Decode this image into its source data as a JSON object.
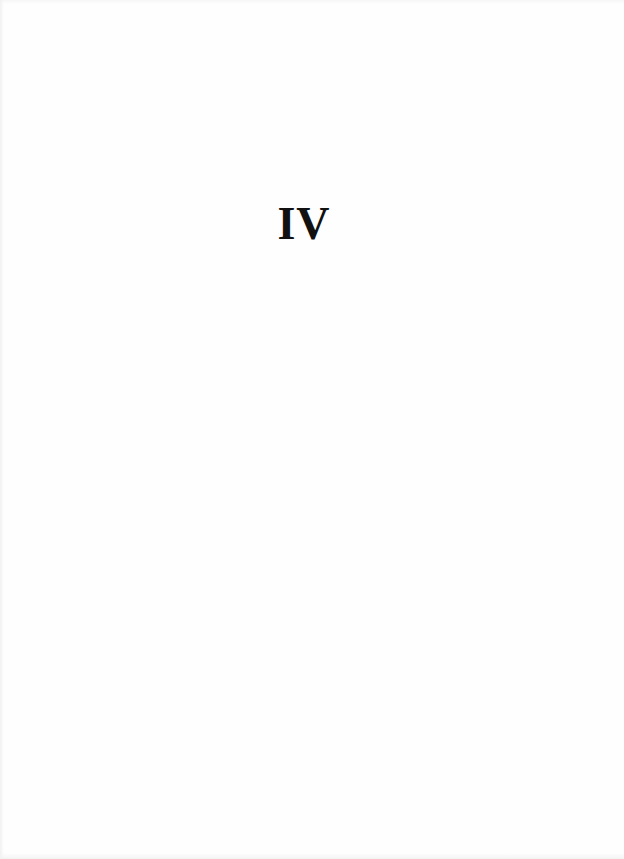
{
  "page": {
    "section_heading": "IV"
  }
}
